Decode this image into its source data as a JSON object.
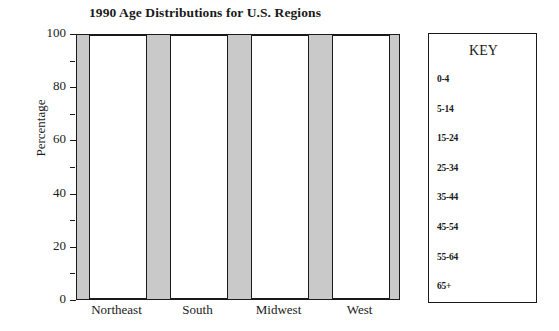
{
  "chart_data": {
    "type": "bar",
    "title": "1990 Age Distributions for U.S. Regions",
    "xlabel": "",
    "ylabel": "Percentage",
    "ylim": [
      0,
      100
    ],
    "grid": false,
    "legend_position": "right",
    "legend_title": "KEY",
    "categories": [
      "Northeast",
      "South",
      "Midwest",
      "West"
    ],
    "y_ticks_major": [
      "0",
      "20",
      "40",
      "60",
      "80",
      "100"
    ],
    "y_ticks_minor": [
      "10",
      "30",
      "50",
      "70",
      "90"
    ],
    "series": [
      {
        "name": "0-4",
        "values": [
          100,
          100,
          100,
          100
        ]
      },
      {
        "name": "5-14",
        "values": [
          0,
          0,
          0,
          0
        ]
      },
      {
        "name": "15-24",
        "values": [
          0,
          0,
          0,
          0
        ]
      },
      {
        "name": "25-34",
        "values": [
          0,
          0,
          0,
          0
        ]
      },
      {
        "name": "35-44",
        "values": [
          0,
          0,
          0,
          0
        ]
      },
      {
        "name": "45-54",
        "values": [
          0,
          0,
          0,
          0
        ]
      },
      {
        "name": "55-64",
        "values": [
          0,
          0,
          0,
          0
        ]
      },
      {
        "name": "65+",
        "values": [
          0,
          0,
          0,
          0
        ]
      }
    ],
    "bar_totals": [
      100,
      100,
      100,
      100
    ],
    "note": "Stacked bars drawn as blank (unfilled white) outlines to 100% on a gray plot background; individual age-group segments are not shaded."
  },
  "colors": {
    "plot_background": "#c9c9c9",
    "bar_fill": "#ffffff",
    "outline": "#1a1a1a",
    "page_background": "#ffffff"
  },
  "key": {
    "title": "KEY",
    "entries": [
      {
        "label": "0-4"
      },
      {
        "label": "5-14"
      },
      {
        "label": "15-24"
      },
      {
        "label": "25-34"
      },
      {
        "label": "35-44"
      },
      {
        "label": "45-54"
      },
      {
        "label": "55-64"
      },
      {
        "label": "65+"
      }
    ]
  }
}
